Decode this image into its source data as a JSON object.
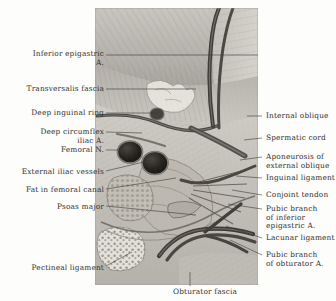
{
  "plate": {
    "title": "Inguinal and femoral region dissection",
    "background_color": "#fdfdfc",
    "text_color": "#30302e"
  },
  "labels_left": [
    {
      "id": "inferior-epigastric-artery",
      "text": "Inferior epigastric\nA.",
      "x": 8,
      "y": 50,
      "width": 96,
      "leader": [
        [
          106,
          55
        ],
        [
          258,
          55
        ]
      ]
    },
    {
      "id": "transversalis-fascia",
      "text": "Transversalis fascia",
      "x": 8,
      "y": 85,
      "width": 96,
      "leader": [
        [
          106,
          89
        ],
        [
          196,
          89
        ]
      ]
    },
    {
      "id": "deep-inguinal-ring",
      "text": "Deep inguinal ring",
      "x": 8,
      "y": 109,
      "width": 96,
      "leader": [
        [
          106,
          113
        ],
        [
          158,
          113
        ]
      ]
    },
    {
      "id": "deep-circumflex-iliac-artery",
      "text": "Deep circumflex\niliac A.",
      "x": 8,
      "y": 128,
      "width": 96,
      "leader": [
        [
          106,
          132
        ],
        [
          142,
          133
        ]
      ]
    },
    {
      "id": "femoral-nerve",
      "text": "Femoral N.",
      "x": 8,
      "y": 146,
      "width": 96,
      "leader": [
        [
          106,
          150
        ],
        [
          130,
          150
        ]
      ]
    },
    {
      "id": "external-iliac-vessels",
      "text": "External iliac vessels",
      "x": 0,
      "y": 168,
      "width": 104,
      "leader": [
        [
          106,
          171
        ],
        [
          152,
          160
        ]
      ]
    },
    {
      "id": "fat-in-femoral-canal",
      "text": "Fat in femoral canal",
      "x": 4,
      "y": 186,
      "width": 100,
      "leader": [
        [
          106,
          189
        ],
        [
          176,
          178
        ]
      ]
    },
    {
      "id": "psoas-major",
      "text": "Psoas major",
      "x": 8,
      "y": 203,
      "width": 96,
      "leader": [
        [
          106,
          206
        ],
        [
          196,
          215
        ]
      ]
    },
    {
      "id": "pectineal-ligament",
      "text": "Pectineal ligament",
      "x": 8,
      "y": 264,
      "width": 96,
      "leader": [
        [
          106,
          266
        ],
        [
          132,
          252
        ]
      ]
    }
  ],
  "labels_right": [
    {
      "id": "internal-oblique",
      "text": "Internal oblique",
      "x": 266,
      "y": 112,
      "width": 70,
      "leader": [
        [
          262,
          116
        ],
        [
          247,
          116
        ]
      ]
    },
    {
      "id": "spermatic-cord",
      "text": "Spermatic cord",
      "x": 266,
      "y": 134,
      "width": 70,
      "leader": [
        [
          262,
          138
        ],
        [
          244,
          140
        ]
      ]
    },
    {
      "id": "aponeurosis-external-oblique",
      "text": "Aponeurosis of\nexternal oblique",
      "x": 266,
      "y": 153,
      "width": 70,
      "leader": [
        [
          262,
          157
        ],
        [
          240,
          160
        ]
      ]
    },
    {
      "id": "inguinal-ligament",
      "text": "Inguinal ligament",
      "x": 266,
      "y": 174,
      "width": 70,
      "leader": [
        [
          262,
          178
        ],
        [
          236,
          176
        ]
      ]
    },
    {
      "id": "conjoint-tendon",
      "text": "Conjoint tendon",
      "x": 266,
      "y": 191,
      "width": 70,
      "leader": [
        [
          262,
          195
        ],
        [
          232,
          190
        ]
      ]
    },
    {
      "id": "pubic-branch-inferior-epigastric",
      "text": "Pubic branch\nof inferior\nepigastric A.",
      "x": 266,
      "y": 205,
      "width": 70,
      "leader": [
        [
          262,
          209
        ],
        [
          228,
          204
        ]
      ]
    },
    {
      "id": "lacunar-ligament",
      "text": "Lacunar ligament",
      "x": 266,
      "y": 234,
      "width": 70,
      "leader": [
        [
          262,
          238
        ],
        [
          226,
          226
        ]
      ]
    },
    {
      "id": "pubic-branch-obturator",
      "text": "Pubic branch\nof obturator A.",
      "x": 266,
      "y": 251,
      "width": 70,
      "leader": [
        [
          262,
          255
        ],
        [
          230,
          240
        ]
      ]
    }
  ],
  "labels_bottom": [
    {
      "id": "obturator-fascia",
      "text": "Obturator fascia",
      "x": 160,
      "y": 288,
      "width": 90,
      "leader": [
        [
          190,
          286
        ],
        [
          190,
          272
        ]
      ]
    }
  ]
}
